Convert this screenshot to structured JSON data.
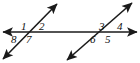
{
  "figure": {
    "background_color": "#ffffff",
    "line_color": "#1a1a1a",
    "label_color": "#101010",
    "width": 140,
    "height": 63
  },
  "lines": [
    {
      "id": "transversal-horizontal",
      "name": "horizontal-line",
      "orientation": "horizontal",
      "x1": 3,
      "y1": 32,
      "x2": 137,
      "y2": 32,
      "arrow_start": true,
      "arrow_end": true
    },
    {
      "id": "parallel-left",
      "name": "left-diagonal-line",
      "orientation": "diagonal",
      "x1": 3,
      "y1": 59,
      "x2": 57,
      "y2": 4,
      "arrow_start": true,
      "arrow_end": true
    },
    {
      "id": "parallel-right",
      "name": "right-diagonal-line",
      "orientation": "diagonal",
      "x1": 67,
      "y1": 60,
      "x2": 132,
      "y2": 3,
      "arrow_start": true,
      "arrow_end": true
    }
  ],
  "vertices": [
    {
      "id": "left-intersection",
      "x": 26,
      "y": 32
    },
    {
      "id": "right-intersection",
      "x": 105,
      "y": 32
    }
  ],
  "angle_labels": [
    {
      "id": "angle-1",
      "text": "1",
      "x": 21,
      "y": 21,
      "vertex": "left-intersection",
      "quadrant": "upper-left"
    },
    {
      "id": "angle-2",
      "text": "2",
      "x": 39,
      "y": 21,
      "vertex": "left-intersection",
      "quadrant": "upper-right"
    },
    {
      "id": "angle-3",
      "text": "3",
      "x": 99,
      "y": 21,
      "vertex": "right-intersection",
      "quadrant": "upper-left"
    },
    {
      "id": "angle-4",
      "text": "4",
      "x": 117,
      "y": 21,
      "vertex": "right-intersection",
      "quadrant": "upper-right"
    },
    {
      "id": "angle-5",
      "text": "5",
      "x": 105,
      "y": 34,
      "vertex": "right-intersection",
      "quadrant": "lower-right"
    },
    {
      "id": "angle-6",
      "text": "6",
      "x": 90,
      "y": 34,
      "vertex": "right-intersection",
      "quadrant": "lower-left"
    },
    {
      "id": "angle-7",
      "text": "7",
      "x": 26,
      "y": 34,
      "vertex": "left-intersection",
      "quadrant": "lower-right"
    },
    {
      "id": "angle-8",
      "text": "8",
      "x": 11,
      "y": 34,
      "vertex": "left-intersection",
      "quadrant": "lower-left"
    }
  ]
}
